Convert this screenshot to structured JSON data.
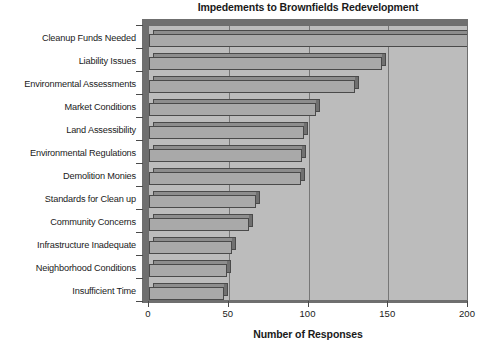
{
  "chart_data": {
    "type": "bar",
    "orientation": "horizontal",
    "title": "Impedements to Brownfields Redevelopment",
    "subtitle": "",
    "xlabel": "Number of Responses",
    "ylabel": "",
    "xlim": [
      0,
      200
    ],
    "xticks": [
      0,
      50,
      100,
      150,
      200
    ],
    "xtick_labels": [
      "0",
      "50",
      "100",
      "150",
      "200"
    ],
    "grid": "vertical",
    "legend": "none",
    "categories": [
      "Cleanup Funds Needed",
      "Liability Issues",
      "Environmental Assessments",
      "Market Conditions",
      "Land Assessibility",
      "Environmental Regulations",
      "Demolition Monies",
      "Standards for Clean up",
      "Community Concerns",
      "Infrastructure Inadequate",
      "Neighborhood Conditions",
      "Insufficient Time"
    ],
    "values": [
      201,
      146,
      129,
      105,
      97,
      96,
      95,
      67,
      63,
      52,
      49,
      47
    ],
    "bar_color": "#a9a9a9",
    "plot_background": "#bcbcbc",
    "axis_color": "#4a4a4a"
  }
}
